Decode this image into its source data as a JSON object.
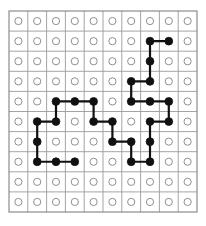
{
  "figure": {
    "type": "lattice-diagram",
    "background_color": "#ffffff"
  },
  "chart_data": {
    "type": "scatter",
    "title": "",
    "subtitle": "",
    "xlabel": "",
    "ylabel": "",
    "grid": true,
    "legend": null,
    "legend_position": "none",
    "rows": 10,
    "columns": 10,
    "xlim": [
      0,
      9
    ],
    "ylim": [
      0,
      9
    ],
    "x_tick_labels": [],
    "y_tick_labels": [],
    "annotations": [],
    "site_states": [
      "empty",
      "occupied"
    ],
    "empty_site_marker": "open-circle",
    "occupied_site_marker": "filled-circle",
    "bond_marker": "line-segment",
    "occupied_sites": [
      [
        1,
        7
      ],
      [
        1,
        8
      ],
      [
        2,
        7
      ],
      [
        3,
        6
      ],
      [
        3,
        7
      ],
      [
        4,
        2
      ],
      [
        4,
        3
      ],
      [
        4,
        4
      ],
      [
        4,
        6
      ],
      [
        4,
        7
      ],
      [
        4,
        8
      ],
      [
        5,
        1
      ],
      [
        5,
        2
      ],
      [
        5,
        4
      ],
      [
        5,
        5
      ],
      [
        5,
        7
      ],
      [
        5,
        8
      ],
      [
        6,
        1
      ],
      [
        6,
        5
      ],
      [
        6,
        6
      ],
      [
        6,
        7
      ],
      [
        7,
        1
      ],
      [
        7,
        2
      ],
      [
        7,
        3
      ],
      [
        7,
        6
      ],
      [
        7,
        7
      ]
    ],
    "horizontal_bonds": [
      [
        1,
        7,
        8
      ],
      [
        3,
        6,
        7
      ],
      [
        4,
        2,
        3
      ],
      [
        4,
        3,
        4
      ],
      [
        4,
        6,
        7
      ],
      [
        4,
        7,
        8
      ],
      [
        5,
        1,
        2
      ],
      [
        5,
        4,
        5
      ],
      [
        5,
        7,
        8
      ],
      [
        6,
        5,
        6
      ],
      [
        7,
        1,
        2
      ],
      [
        7,
        2,
        3
      ],
      [
        7,
        6,
        7
      ]
    ],
    "vertical_bonds": [
      [
        1,
        2,
        7
      ],
      [
        2,
        3,
        7
      ],
      [
        3,
        4,
        6
      ],
      [
        4,
        5,
        2
      ],
      [
        4,
        5,
        4
      ],
      [
        4,
        5,
        8
      ],
      [
        5,
        6,
        1
      ],
      [
        5,
        6,
        5
      ],
      [
        5,
        6,
        7
      ],
      [
        6,
        7,
        1
      ],
      [
        6,
        7,
        6
      ],
      [
        6,
        7,
        7
      ]
    ],
    "counts": {
      "total_sites": 100,
      "occupied_sites": 26,
      "empty_sites": 74,
      "horizontal_bonds": 13,
      "vertical_bonds": 12,
      "total_bonds": 25
    }
  },
  "style": {
    "grid_line_color": "#9a9a9a",
    "grid_border_color": "#8a8a8a",
    "empty_circle_stroke": "#8f8f8f",
    "empty_circle_fill": "#ffffff",
    "occupied_circle_fill": "#111111",
    "occupied_circle_stroke": "#111111",
    "bond_color": "#111111",
    "bond_width": 2.2,
    "grid_line_width": 0.9,
    "empty_radius": 3.6,
    "occupied_radius": 3.9,
    "origin_x": 9,
    "origin_y": 11,
    "cell_width": 18.8,
    "cell_height": 20.1
  }
}
